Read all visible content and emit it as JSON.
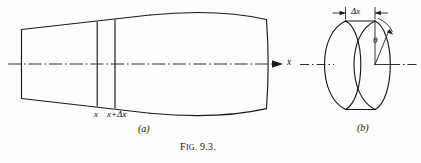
{
  "figure": {
    "caption_prefix": "F",
    "caption_smallcaps": "IG.",
    "caption_number": " 9.3.",
    "caption_full": "Fig. 9.3."
  },
  "panel_a": {
    "part_label": "(a)",
    "axis_label": "x",
    "slice_left_label": "x",
    "slice_right_label": "x+Δx",
    "description": "Axisymmetric body of revolution (conical nose blending into a barrel body) with a thin differential slice between x and x+Δx, centerline axis with rightward arrow labeled x"
  },
  "panel_b": {
    "part_label": "(b)",
    "thickness_label": "Δx",
    "angle_label": "θ",
    "description": "Elemental disk of thickness Δx shown in oblique view with polar angle θ measured from the vertical radius, centerline axis passing through"
  },
  "colors": {
    "ink": "#1a1a1a",
    "axis": "#2b2b2b",
    "background": "#fdfdfc"
  }
}
